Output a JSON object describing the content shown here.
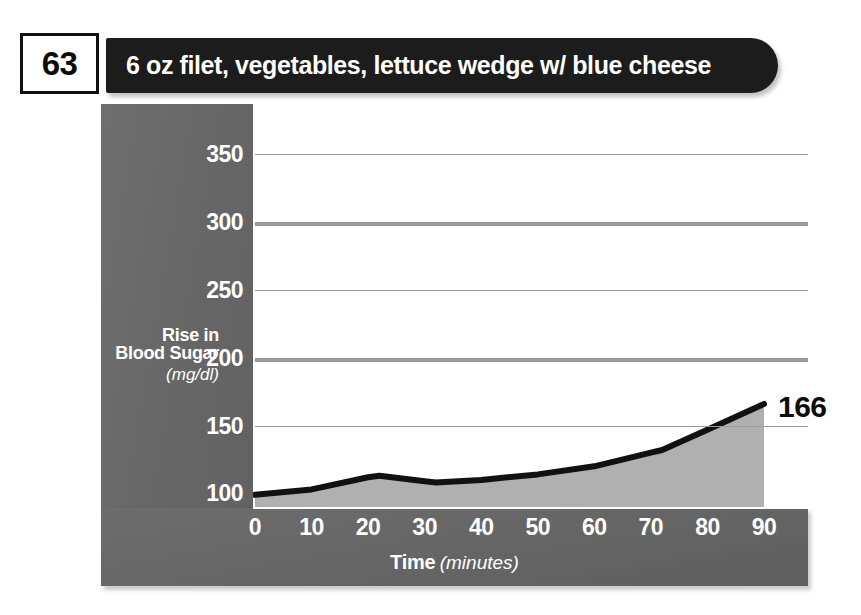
{
  "header": {
    "badge_number": "63",
    "meal_title": "6 oz filet, vegetables, lettuce wedge w/ blue cheese"
  },
  "chart_data": {
    "type": "area",
    "title": "6 oz filet, vegetables, lettuce wedge w/ blue cheese",
    "xlabel_main": "Time",
    "xlabel_unit": "(minutes)",
    "ylabel_main": "Rise in Blood Sugar",
    "ylabel_unit": "(mg/dl)",
    "x": [
      0,
      10,
      20,
      22,
      30,
      32,
      40,
      50,
      60,
      70,
      72,
      80,
      90
    ],
    "values": [
      99,
      103,
      112,
      113,
      109,
      108,
      110,
      114,
      120,
      130,
      132,
      147,
      166
    ],
    "xticks": [
      0,
      10,
      20,
      30,
      40,
      50,
      60,
      70,
      80,
      90
    ],
    "yticks": [
      100,
      150,
      200,
      250,
      300,
      350
    ],
    "strong_gridlines": [
      200,
      300
    ],
    "xlim": [
      0,
      90
    ],
    "ylim": [
      90,
      365
    ],
    "grid": true,
    "legend": "none",
    "end_label": "166",
    "end_label_value": 166,
    "series_name": "Blood glucose response",
    "colors": {
      "area_fill": "#b0b0b0",
      "line": "#111111",
      "panel": "#6a6a6a",
      "plot_background": "#ffffff",
      "gridline": "#9a9a9a",
      "title_bar": "#1c1c1c",
      "text_light": "#ffffff",
      "text_dark": "#0d0d0d"
    }
  }
}
